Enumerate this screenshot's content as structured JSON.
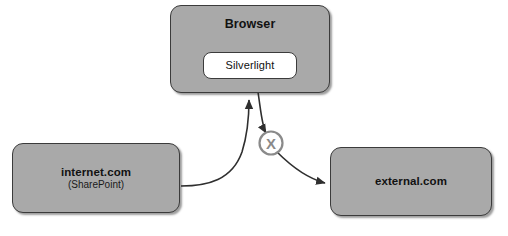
{
  "diagram": {
    "background_color": "#ffffff",
    "node_fill_color": "#a9a9a9",
    "node_border_color": "#3b3b3b",
    "edge_color": "#2f2f2f",
    "block_marker_color": "#8a8a8a",
    "nodes": {
      "browser": {
        "label": "Browser",
        "plugin": {
          "label": "Silverlight"
        }
      },
      "internet": {
        "label": "internet.com",
        "sublabel": "(SharePoint)"
      },
      "external": {
        "label": "external.com"
      }
    },
    "edges": [
      {
        "id": "internet-to-browser",
        "from": "internet.com",
        "to": "Browser",
        "style": "curved-arrow",
        "blocked": false
      },
      {
        "id": "silverlight-to-external",
        "from": "Silverlight",
        "to": "external.com",
        "style": "curved-arrow",
        "blocked": true,
        "block_marker": "X"
      }
    ],
    "block_marker": {
      "symbol": "X"
    }
  }
}
